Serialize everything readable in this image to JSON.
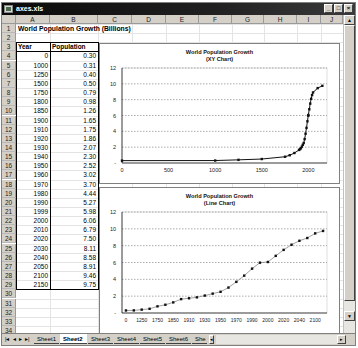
{
  "window": {
    "title": "axes.xls",
    "buttons": {
      "minimize": "_",
      "maximize": "□",
      "close": "×"
    }
  },
  "columns": [
    "A",
    "B",
    "C",
    "D",
    "E",
    "F",
    "G",
    "H",
    "I",
    "J"
  ],
  "rows": [
    "1",
    "2",
    "3",
    "4",
    "5",
    "6",
    "7",
    "8",
    "9",
    "10",
    "11",
    "12",
    "13",
    "14",
    "15",
    "16",
    "17",
    "18",
    "19",
    "20",
    "21",
    "22",
    "23",
    "24",
    "25",
    "26",
    "27",
    "28",
    "29",
    "30",
    "31",
    "32",
    "33",
    "34"
  ],
  "sheet": {
    "title": "World Population Growth (Billions)",
    "table": {
      "headers": [
        "Year",
        "Population"
      ],
      "rows": [
        [
          "0",
          "0.30"
        ],
        [
          "1000",
          "0.31"
        ],
        [
          "1250",
          "0.40"
        ],
        [
          "1500",
          "0.50"
        ],
        [
          "1750",
          "0.79"
        ],
        [
          "1800",
          "0.98"
        ],
        [
          "1850",
          "1.26"
        ],
        [
          "1900",
          "1.65"
        ],
        [
          "1910",
          "1.75"
        ],
        [
          "1920",
          "1.86"
        ],
        [
          "1930",
          "2.07"
        ],
        [
          "1940",
          "2.30"
        ],
        [
          "1950",
          "2.52"
        ],
        [
          "1960",
          "3.02"
        ],
        [
          "1970",
          "3.70"
        ],
        [
          "1980",
          "4.44"
        ],
        [
          "1990",
          "5.27"
        ],
        [
          "1999",
          "5.98"
        ],
        [
          "2000",
          "6.06"
        ],
        [
          "2010",
          "6.79"
        ],
        [
          "2020",
          "7.50"
        ],
        [
          "2030",
          "8.11"
        ],
        [
          "2040",
          "8.58"
        ],
        [
          "2050",
          "8.91"
        ],
        [
          "2100",
          "9.46"
        ],
        [
          "2150",
          "9.75"
        ]
      ]
    }
  },
  "chart_data": [
    {
      "type": "scatter",
      "title": "World Population Growth",
      "subtitle": "(XY Chart)",
      "xlabel": "",
      "ylabel": "",
      "x": [
        0,
        1000,
        1250,
        1500,
        1750,
        1800,
        1850,
        1900,
        1910,
        1920,
        1930,
        1940,
        1950,
        1960,
        1970,
        1980,
        1990,
        1999,
        2000,
        2010,
        2020,
        2030,
        2040,
        2050,
        2100,
        2150
      ],
      "series": [
        {
          "name": "Population",
          "values": [
            0.3,
            0.31,
            0.4,
            0.5,
            0.79,
            0.98,
            1.26,
            1.65,
            1.75,
            1.86,
            2.07,
            2.3,
            2.52,
            3.02,
            3.7,
            4.44,
            5.27,
            5.98,
            6.06,
            6.79,
            7.5,
            8.11,
            8.58,
            8.91,
            9.46,
            9.75
          ]
        }
      ],
      "xticks": [
        "0",
        "500",
        "1000",
        "1500",
        "2000"
      ],
      "yticks": [
        "-",
        "2",
        "4",
        "6",
        "8",
        "10",
        "12"
      ],
      "xlim": [
        0,
        2200
      ],
      "ylim": [
        0,
        12
      ],
      "grid": "horizontal dashed",
      "legend": "none"
    },
    {
      "type": "line",
      "title": "World Population Growth",
      "subtitle": "(Line Chart)",
      "xlabel": "",
      "ylabel": "",
      "categories": [
        "0",
        "1000",
        "1250",
        "1500",
        "1750",
        "1800",
        "1850",
        "1900",
        "1910",
        "1920",
        "1930",
        "1940",
        "1950",
        "1960",
        "1970",
        "1980",
        "1990",
        "1999",
        "2000",
        "2010",
        "2020",
        "2030",
        "2040",
        "2050",
        "2100",
        "2150"
      ],
      "series": [
        {
          "name": "Population",
          "values": [
            0.3,
            0.31,
            0.4,
            0.5,
            0.79,
            0.98,
            1.26,
            1.65,
            1.75,
            1.86,
            2.07,
            2.3,
            2.52,
            3.02,
            3.7,
            4.44,
            5.27,
            5.98,
            6.06,
            6.79,
            7.5,
            8.11,
            8.58,
            8.91,
            9.46,
            9.75
          ]
        }
      ],
      "xticks": [
        "0",
        "1250",
        "1750",
        "1850",
        "1910",
        "1930",
        "1950",
        "1970",
        "1990",
        "2000",
        "2020",
        "2040",
        "2100"
      ],
      "yticks": [
        "-",
        "2",
        "4",
        "6",
        "8",
        "10",
        "12"
      ],
      "ylim": [
        0,
        12
      ],
      "grid": "horizontal dashed",
      "legend": "none"
    }
  ],
  "tabs": {
    "nav": [
      "|◂",
      "◂",
      "▸",
      "▸|"
    ],
    "sheets": [
      "Sheet1",
      "Sheet2",
      "Sheet3",
      "Sheet4",
      "Sheet5",
      "Sheet6",
      "She"
    ],
    "active": "Sheet2"
  }
}
